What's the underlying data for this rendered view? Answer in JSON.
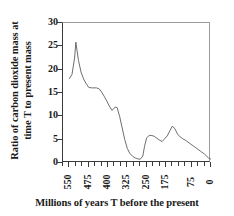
{
  "chart_data": {
    "type": "line",
    "title": "",
    "xlabel": "Millions of years T before the present",
    "ylabel_lines": [
      "Ratio of carbon dioxide mass at",
      "time T to present mass"
    ],
    "ylabel": "Ratio of carbon dioxide mass at time T to present mass",
    "xlim": [
      575,
      0
    ],
    "ylim": [
      0,
      30
    ],
    "x_axis_reversed": true,
    "grid": false,
    "legend": null,
    "yticks": [
      0,
      5,
      10,
      15,
      20,
      25,
      30
    ],
    "ytick_labels": [
      "0",
      "5",
      "10",
      "15",
      "20",
      "25",
      "30"
    ],
    "xticks": [
      550,
      475,
      400,
      325,
      250,
      175,
      75,
      0
    ],
    "xtick_labels": [
      "550",
      "475",
      "400",
      "325",
      "250",
      "175",
      "75",
      "0"
    ],
    "x_minor_tick_step": 25,
    "line_color": "#6e6e6e",
    "axis_color": "#3a3a3a",
    "series": [
      {
        "name": "CO2 mass ratio",
        "x": [
          550,
          540,
          530,
          525,
          515,
          505,
          495,
          485,
          475,
          465,
          455,
          445,
          435,
          425,
          415,
          405,
          395,
          385,
          380,
          372,
          365,
          355,
          345,
          335,
          325,
          315,
          305,
          295,
          285,
          275,
          265,
          258,
          250,
          240,
          230,
          220,
          210,
          200,
          190,
          180,
          170,
          160,
          150,
          140,
          130,
          120,
          110,
          100,
          85,
          70,
          55,
          40,
          25,
          10,
          0
        ],
        "y": [
          18.1,
          19.0,
          22.5,
          25.9,
          22.0,
          19.5,
          18.0,
          17.0,
          16.2,
          16.1,
          16.1,
          16.1,
          15.9,
          15.2,
          14.3,
          13.3,
          12.2,
          11.3,
          11.5,
          12.0,
          11.9,
          10.0,
          7.5,
          5.0,
          3.1,
          2.0,
          1.5,
          1.1,
          0.9,
          0.8,
          1.5,
          3.6,
          5.4,
          5.9,
          5.9,
          5.7,
          5.3,
          4.9,
          4.6,
          5.2,
          5.8,
          6.9,
          7.9,
          7.3,
          6.2,
          5.6,
          5.2,
          4.9,
          4.3,
          3.7,
          3.1,
          2.5,
          1.9,
          1.1,
          0.8
        ]
      }
    ]
  },
  "annotations": {
    "primary_peak_value": 25.9,
    "primary_peak_x": 525,
    "secondary_peak_value": 7.9,
    "secondary_peak_x": 150,
    "minimum_value": 0.8,
    "present_value": 0.8
  }
}
